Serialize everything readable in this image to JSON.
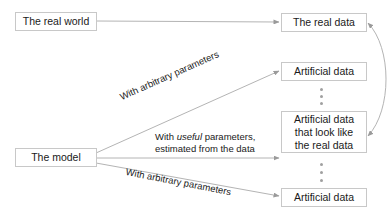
{
  "nodes": {
    "real_world": "The real world",
    "real_data": "The real data",
    "model": "The model",
    "artificial_top": "Artificial data",
    "artificial_middle_l1": "Artificial data",
    "artificial_middle_l2": "that look like",
    "artificial_middle_l3": "the real data",
    "artificial_bottom": "Artificial data"
  },
  "edges": {
    "top_label": "With arbitrary parameters",
    "middle_label_prefix": "With ",
    "middle_label_emph": "useful",
    "middle_label_suffix": " parameters,",
    "middle_label_line2": "estimated from the data",
    "bottom_label": "With arbitrary parameters"
  },
  "colors": {
    "edge": "#b4b4b4",
    "box_border": "#c8c8c8",
    "dots": "#a0a0a0"
  }
}
